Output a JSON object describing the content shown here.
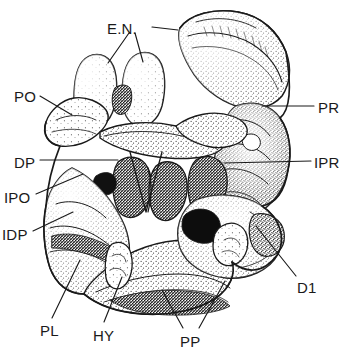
{
  "figure": {
    "kind": "scientific-illustration",
    "technique": "pen-and-ink stipple shading",
    "background_color": "#ffffff",
    "ink_color": "#1a1a1a",
    "caption_fragment": "2001.)",
    "labels": [
      {
        "id": "en",
        "text": "E.N.",
        "x": 107,
        "y": 21
      },
      {
        "id": "po",
        "text": "PO",
        "x": 14,
        "y": 89
      },
      {
        "id": "pr",
        "text": "PR",
        "x": 318,
        "y": 100
      },
      {
        "id": "dp",
        "text": "DP",
        "x": 14,
        "y": 155
      },
      {
        "id": "ipr",
        "text": "IPR",
        "x": 314,
        "y": 155
      },
      {
        "id": "ipo",
        "text": "IPO",
        "x": 4,
        "y": 190
      },
      {
        "id": "idp",
        "text": "IDP",
        "x": 2,
        "y": 227
      },
      {
        "id": "d1",
        "text": "D1",
        "x": 297,
        "y": 280
      },
      {
        "id": "pl",
        "text": "PL",
        "x": 40,
        "y": 323
      },
      {
        "id": "hy",
        "text": "HY",
        "x": 93,
        "y": 328
      },
      {
        "id": "pp",
        "text": "PP",
        "x": 180,
        "y": 334
      }
    ],
    "leader_lines": [
      {
        "from": "en",
        "d": "M 152 27 L 178 30"
      },
      {
        "from": "en",
        "d": "M 129 33 L 108 63"
      },
      {
        "from": "en",
        "d": "M 135 33 L 143 62"
      },
      {
        "from": "po",
        "d": "M 40 96 L 72 115"
      },
      {
        "from": "pr",
        "d": "M 314 106 L 262 106"
      },
      {
        "from": "dp",
        "d": "M 40 160 L 118 160"
      },
      {
        "from": "ipr",
        "d": "M 311 161 L 224 163"
      },
      {
        "from": "ipo",
        "d": "M 36 194 L 83 174"
      },
      {
        "from": "idp",
        "d": "M 33 231 L 73 212"
      },
      {
        "from": "d1",
        "d": "M 296 276 L 256 226"
      },
      {
        "from": "pl",
        "d": "M 52 318 L 80 260"
      },
      {
        "from": "hy",
        "d": "M 104 322 L 122 277"
      },
      {
        "from": "pp",
        "d": "M 183 328 L 162 290"
      },
      {
        "from": "pp",
        "d": "M 199 328 L 225 281"
      }
    ]
  }
}
